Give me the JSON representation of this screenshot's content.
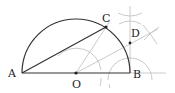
{
  "diagram": {
    "title": "",
    "points": {
      "A": {
        "label": "A",
        "x": 22,
        "y": 73
      },
      "B": {
        "label": "B",
        "x": 130,
        "y": 73
      },
      "O": {
        "label": "O",
        "x": 76,
        "y": 73
      },
      "C": {
        "label": "C",
        "x": 106,
        "y": 27
      },
      "D": {
        "label": "D",
        "x": 130,
        "y": 43
      }
    },
    "shapes": {
      "semicircle": "Semicircle on diameter AB with center O",
      "chord": "AC",
      "diameter": "AB",
      "construction_lines": [
        "OC extended",
        "OD extended",
        "perpendicular at B",
        "AB extended"
      ],
      "construction_arcs": [
        "arcs centered at O",
        "arcs centered at B",
        "intersection marks near top"
      ]
    },
    "colors": {
      "main_stroke": "#333333",
      "construction_stroke": "#bbbbbb",
      "label": "#222222"
    }
  }
}
